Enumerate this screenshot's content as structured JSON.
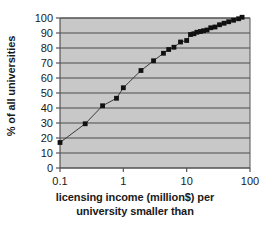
{
  "chart_data": {
    "type": "line",
    "title": "",
    "subtitle": "",
    "xlabel_line1": "licensing income (million$) per",
    "xlabel_line2": "university smaller than",
    "xlabel": "licensing income (million$) per university smaller than",
    "ylabel": "% of all universities",
    "xscale": "log",
    "yscale": "linear",
    "xlim": [
      0.1,
      100
    ],
    "ylim": [
      0,
      100
    ],
    "grid": "horizontal",
    "legend": "none",
    "xticks": [
      "0.1",
      "1",
      "10",
      "100"
    ],
    "xtick_values": [
      0.1,
      1,
      10,
      100
    ],
    "yticks": [
      "0",
      "10",
      "20",
      "30",
      "40",
      "50",
      "60",
      "70",
      "80",
      "90",
      "100"
    ],
    "ytick_values": [
      0,
      10,
      20,
      30,
      40,
      50,
      60,
      70,
      80,
      90,
      100
    ],
    "marker": "square",
    "marker_color": "#111111",
    "line_color": "#3a3a3a",
    "plot_background": "#c8c8c8",
    "gridline_color": "#4a4a4a",
    "axis_color": "#555555",
    "series": [
      {
        "name": "cumulative share of universities",
        "x": [
          0.1,
          0.25,
          0.47,
          0.78,
          1.0,
          1.9,
          3.0,
          4.3,
          5.2,
          6.3,
          8.0,
          10.0,
          11.5,
          13.0,
          14.5,
          16.5,
          18.5,
          21.0,
          24.0,
          28.0,
          33.0,
          39.0,
          46.0,
          55.0,
          66.0,
          75.0
        ],
        "y": [
          17,
          29.5,
          41.5,
          46.5,
          53.5,
          65,
          71.5,
          76.5,
          79,
          80.5,
          84,
          85,
          89,
          89.5,
          90.5,
          91,
          91.5,
          92,
          93.5,
          94,
          95.5,
          96.5,
          97.5,
          98.5,
          99.5,
          100.5
        ]
      }
    ]
  }
}
